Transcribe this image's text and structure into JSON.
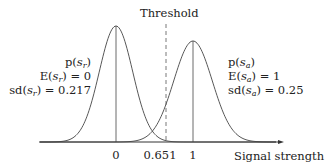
{
  "chart_data": {
    "type": "line",
    "title": "",
    "xlabel": "Signal strength",
    "ylabel": "",
    "x_ticks": [
      {
        "value": 0,
        "label": "0"
      },
      {
        "value": 0.651,
        "label": "0.651"
      },
      {
        "value": 1,
        "label": "1"
      }
    ],
    "series": [
      {
        "name": "p(s_r)",
        "distribution": "normal",
        "mean": 0,
        "sd": 0.217,
        "labels": [
          "p(s_r)",
          "E(s_r) = 0",
          "sd(s_r) = 0.217"
        ]
      },
      {
        "name": "p(s_a)",
        "distribution": "normal",
        "mean": 1,
        "sd": 0.25,
        "labels": [
          "p(s_a)",
          "E(s_a) = 1",
          "sd(s_a) = 0.25"
        ]
      }
    ],
    "annotations": [
      {
        "type": "vline",
        "x": 0.651,
        "style": "dashed",
        "label": "Threshold"
      }
    ],
    "grid": false
  },
  "labels": {
    "threshold": "Threshold",
    "xlabel": "Signal strength",
    "tick0": "0",
    "tick_thr": "0.651",
    "tick1": "1",
    "left": {
      "p": "p(",
      "e": "E(",
      "e_val": ") = 0",
      "sd": "sd(",
      "sd_val": ") = 0.217",
      "var": "s",
      "sub": "r"
    },
    "right": {
      "p": "p(",
      "e": "E(",
      "e_val": ") = 1",
      "sd": "sd(",
      "sd_val": ") = 0.25",
      "var": "s",
      "sub": "a"
    }
  }
}
